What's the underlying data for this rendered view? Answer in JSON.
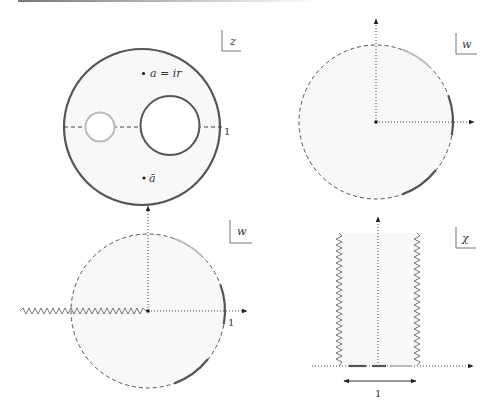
{
  "figure": {
    "panels": [
      {
        "id": "z-plane",
        "plane_label": "z",
        "points": [
          {
            "label": "a = ir"
          },
          {
            "label": "ā"
          }
        ],
        "axis_tick_label": "1",
        "description": "Unit disk with two holes: small light-gray circle on the left, larger dark circle on the right, centered on the real axis"
      },
      {
        "id": "w-plane-top",
        "plane_label": "w",
        "description": "Dashed unit circle with highlighted boundary arcs (one light, two dark) and dotted axes"
      },
      {
        "id": "w-plane-bottom",
        "plane_label": "w",
        "axis_tick_label": "1",
        "description": "Dashed unit circle with branch cut (zigzag) along negative real axis and highlighted boundary arcs"
      },
      {
        "id": "chi-plane",
        "plane_label": "χ",
        "width_label": "1",
        "description": "Vertical strip of width 1 bounded by zigzag branch cuts, with highlighted segments on the real axis"
      }
    ],
    "colors": {
      "dark_curve": "#555555",
      "light_curve": "#b8b8b8",
      "axis": "#333333",
      "shade": "#f7f7f7"
    }
  }
}
